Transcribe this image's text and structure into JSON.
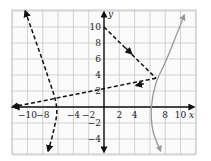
{
  "chart_data": {
    "type": "line",
    "title": "",
    "xlabel": "x",
    "ylabel": "y",
    "xlim": [
      -12,
      12
    ],
    "ylim": [
      -6,
      12
    ],
    "grid": true,
    "x_ticks": [
      "-10",
      "-8",
      "-4",
      "-2",
      "2",
      "4",
      "8",
      "10"
    ],
    "y_ticks": [
      "10",
      "8",
      "6",
      "4",
      "2",
      "-2",
      "-4"
    ],
    "series": [
      {
        "name": "dashed-segment-1",
        "style": "dashed",
        "color": "#111111",
        "points": [
          [
            0,
            10
          ],
          [
            6.8,
            3.6
          ]
        ]
      },
      {
        "name": "dashed-segment-2",
        "style": "dashed",
        "color": "#111111",
        "points": [
          [
            6.8,
            3.6
          ],
          [
            -12,
            0
          ]
        ]
      },
      {
        "name": "dashed-curve-left",
        "style": "dashed",
        "color": "#111111",
        "points": [
          [
            -10.3,
            12
          ],
          [
            -7.4,
            4
          ],
          [
            -6.2,
            0
          ],
          [
            -6.6,
            -3
          ],
          [
            -7.3,
            -5.5
          ]
        ]
      },
      {
        "name": "gray-curve",
        "style": "solid",
        "color": "#999999",
        "points": [
          [
            10.5,
            11.5
          ],
          [
            8.2,
            6
          ],
          [
            6.8,
            3
          ],
          [
            6.2,
            0
          ],
          [
            6.4,
            -3
          ],
          [
            7.4,
            -5.5
          ]
        ]
      }
    ]
  },
  "axes": {
    "x_label": "x",
    "y_label": "y"
  },
  "ticks": {
    "x": [
      {
        "v": -10,
        "t": "−10"
      },
      {
        "v": -8,
        "t": "−8"
      },
      {
        "v": -4,
        "t": "−4"
      },
      {
        "v": -2,
        "t": "−2"
      },
      {
        "v": 2,
        "t": "2"
      },
      {
        "v": 4,
        "t": "4"
      },
      {
        "v": 8,
        "t": "8"
      },
      {
        "v": 10,
        "t": "10"
      }
    ],
    "y": [
      {
        "v": 10,
        "t": "10"
      },
      {
        "v": 8,
        "t": "8"
      },
      {
        "v": 6,
        "t": "6"
      },
      {
        "v": 4,
        "t": "4"
      },
      {
        "v": 2,
        "t": "2"
      },
      {
        "v": -2,
        "t": "−2"
      },
      {
        "v": -4,
        "t": "−4"
      }
    ]
  }
}
